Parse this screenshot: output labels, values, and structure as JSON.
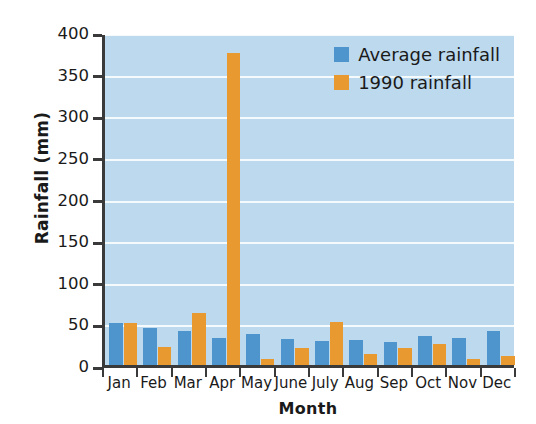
{
  "chart_data": {
    "type": "bar",
    "title": "",
    "xlabel": "Month",
    "ylabel": "Rainfall (mm)",
    "categories": [
      "Jan",
      "Feb",
      "Mar",
      "Apr",
      "May",
      "June",
      "July",
      "Aug",
      "Sep",
      "Oct",
      "Nov",
      "Dec"
    ],
    "series": [
      {
        "name": "Average rainfall",
        "color": "#4e95ce",
        "values": [
          51,
          44,
          41,
          33,
          37,
          31,
          29,
          30,
          28,
          35,
          33,
          41
        ]
      },
      {
        "name": "1990  rainfall",
        "color": "#e89a30",
        "values": [
          51,
          22,
          62,
          375,
          7,
          21,
          52,
          13,
          21,
          25,
          7,
          11
        ]
      }
    ],
    "ylim": [
      0,
      400
    ],
    "yticks": [
      0,
      50,
      100,
      150,
      200,
      250,
      300,
      350,
      400
    ],
    "ytick_labels": [
      "0",
      "50",
      "100",
      "150",
      "200",
      "250",
      "300",
      "350",
      "400"
    ],
    "grid": "horizontal",
    "grid_color": "#ffffff",
    "plot_background": "#bcd9ee",
    "legend_position": "top-right-inside"
  }
}
